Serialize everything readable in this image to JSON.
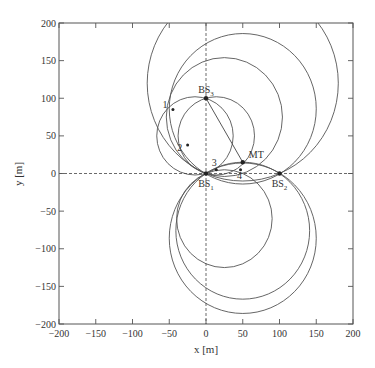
{
  "chart_data": {
    "type": "scatter",
    "title": "",
    "xlabel": "x [m]",
    "ylabel": "y [m]",
    "xlim": [
      -200,
      200
    ],
    "ylim": [
      -200,
      200
    ],
    "xticks": [
      -200,
      -150,
      -100,
      -50,
      0,
      50,
      100,
      150,
      200
    ],
    "yticks": [
      -200,
      -150,
      -100,
      -50,
      0,
      50,
      100,
      150,
      200
    ],
    "grid": false,
    "axis_lines": {
      "x0_dashed": true,
      "y0_dashed": true
    },
    "points": [
      {
        "name": "BS1",
        "label": "BS",
        "sub": "1",
        "x": 0,
        "y": 0,
        "label_pos": "below"
      },
      {
        "name": "BS2",
        "label": "BS",
        "sub": "2",
        "x": 100,
        "y": 0,
        "label_pos": "below"
      },
      {
        "name": "BS3",
        "label": "BS",
        "sub": "3",
        "x": 0,
        "y": 100,
        "label_pos": "above"
      },
      {
        "name": "MT",
        "label": "MT",
        "sub": "",
        "x": 50,
        "y": 15,
        "label_pos": "above-right"
      }
    ],
    "intersections": [
      {
        "label": "1",
        "x": -45,
        "y": 85
      },
      {
        "label": "2",
        "x": -25,
        "y": 38
      },
      {
        "label": "3",
        "x": 14,
        "y": 5
      },
      {
        "label": "4",
        "x": 47,
        "y": 5
      }
    ],
    "circles": [
      {
        "name": "large-upper",
        "cx": 50,
        "cy": 86,
        "r": 100
      },
      {
        "name": "large-lower",
        "cx": 50,
        "cy": -86,
        "r": 100
      },
      {
        "name": "left-medium",
        "cx": -15,
        "cy": 50,
        "r": 52
      },
      {
        "name": "right-medium",
        "cx": 14,
        "cy": 50,
        "r": 52
      },
      {
        "name": "lens-upper",
        "cx": 50,
        "cy": -76,
        "r": 91
      },
      {
        "name": "lens-lower",
        "cx": 50,
        "cy": 120,
        "r": 130
      },
      {
        "name": "small-lens-a",
        "cx": 25,
        "cy": -60,
        "r": 65
      },
      {
        "name": "small-lens-b",
        "cx": 25,
        "cy": 75,
        "r": 79
      }
    ],
    "segments": [
      {
        "name": "bs3-to-mt",
        "from": [
          0,
          100
        ],
        "to": [
          50,
          15
        ]
      }
    ]
  }
}
